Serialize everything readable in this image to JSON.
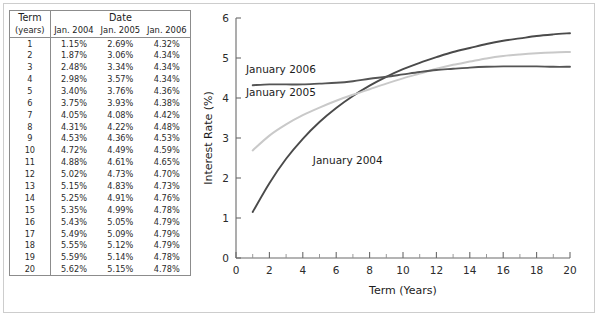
{
  "figure": {
    "background_color": "#ffffff",
    "frame_color": "#cdcdcd"
  },
  "table": {
    "name": "yield-curve-rate-table",
    "header": {
      "term_label": "Term",
      "term_units": "(years)",
      "group_label": "Date",
      "columns": [
        "Jan. 2004",
        "Jan. 2005",
        "Jan. 2006"
      ]
    },
    "column_colors": {
      "jan_2004": "#3f3f3f",
      "jan_2005": "#a8a8a8",
      "jan_2006": "#2b2b2b"
    },
    "rows": [
      {
        "term": "1",
        "jan_2004": "1.15%",
        "jan_2005": "2.69%",
        "jan_2006": "4.32%"
      },
      {
        "term": "2",
        "jan_2004": "1.87%",
        "jan_2005": "3.06%",
        "jan_2006": "4.34%"
      },
      {
        "term": "3",
        "jan_2004": "2.48%",
        "jan_2005": "3.34%",
        "jan_2006": "4.34%"
      },
      {
        "term": "4",
        "jan_2004": "2.98%",
        "jan_2005": "3.57%",
        "jan_2006": "4.34%"
      },
      {
        "term": "5",
        "jan_2004": "3.40%",
        "jan_2005": "3.76%",
        "jan_2006": "4.36%"
      },
      {
        "term": "6",
        "jan_2004": "3.75%",
        "jan_2005": "3.93%",
        "jan_2006": "4.38%"
      },
      {
        "term": "7",
        "jan_2004": "4.05%",
        "jan_2005": "4.08%",
        "jan_2006": "4.42%"
      },
      {
        "term": "8",
        "jan_2004": "4.31%",
        "jan_2005": "4.22%",
        "jan_2006": "4.48%"
      },
      {
        "term": "9",
        "jan_2004": "4.53%",
        "jan_2005": "4.36%",
        "jan_2006": "4.53%"
      },
      {
        "term": "10",
        "jan_2004": "4.72%",
        "jan_2005": "4.49%",
        "jan_2006": "4.59%"
      },
      {
        "term": "11",
        "jan_2004": "4.88%",
        "jan_2005": "4.61%",
        "jan_2006": "4.65%"
      },
      {
        "term": "12",
        "jan_2004": "5.02%",
        "jan_2005": "4.73%",
        "jan_2006": "4.70%"
      },
      {
        "term": "13",
        "jan_2004": "5.15%",
        "jan_2005": "4.83%",
        "jan_2006": "4.73%"
      },
      {
        "term": "14",
        "jan_2004": "5.25%",
        "jan_2005": "4.91%",
        "jan_2006": "4.76%"
      },
      {
        "term": "15",
        "jan_2004": "5.35%",
        "jan_2005": "4.99%",
        "jan_2006": "4.78%"
      },
      {
        "term": "16",
        "jan_2004": "5.43%",
        "jan_2005": "5.05%",
        "jan_2006": "4.79%"
      },
      {
        "term": "17",
        "jan_2004": "5.49%",
        "jan_2005": "5.09%",
        "jan_2006": "4.79%"
      },
      {
        "term": "18",
        "jan_2004": "5.55%",
        "jan_2005": "5.12%",
        "jan_2006": "4.79%"
      },
      {
        "term": "19",
        "jan_2004": "5.59%",
        "jan_2005": "5.14%",
        "jan_2006": "4.78%"
      },
      {
        "term": "20",
        "jan_2004": "5.62%",
        "jan_2005": "5.15%",
        "jan_2006": "4.78%"
      }
    ]
  },
  "chart_data": {
    "type": "line",
    "title": "",
    "xlabel": "Term (Years)",
    "ylabel": "Interest Rate (%)",
    "xlim": [
      0,
      20
    ],
    "ylim": [
      0,
      6
    ],
    "xticks": [
      0,
      2,
      4,
      6,
      8,
      10,
      12,
      14,
      16,
      18,
      20
    ],
    "xtick_labels": [
      "0",
      "2",
      "4",
      "6",
      "8",
      "10",
      "12",
      "14",
      "16",
      "18",
      "20"
    ],
    "xminor_step": 1,
    "yticks": [
      0,
      1,
      2,
      3,
      4,
      5,
      6
    ],
    "ytick_labels": [
      "0",
      "1",
      "2",
      "3",
      "4",
      "5",
      "6"
    ],
    "grid": false,
    "legend_position": "inline-annotations",
    "x": [
      1,
      2,
      3,
      4,
      5,
      6,
      7,
      8,
      9,
      10,
      11,
      12,
      13,
      14,
      15,
      16,
      17,
      18,
      19,
      20
    ],
    "series": [
      {
        "name": "January 2004",
        "color": "#4a4a4a",
        "label_x": 4.6,
        "label_y": 2.35,
        "values": [
          1.15,
          1.87,
          2.48,
          2.98,
          3.4,
          3.75,
          4.05,
          4.31,
          4.53,
          4.72,
          4.88,
          5.02,
          5.15,
          5.25,
          5.35,
          5.43,
          5.49,
          5.55,
          5.59,
          5.62
        ]
      },
      {
        "name": "January 2005",
        "color": "#c9c9c9",
        "label_x": 0.6,
        "label_y": 4.05,
        "values": [
          2.69,
          3.06,
          3.34,
          3.57,
          3.76,
          3.93,
          4.08,
          4.22,
          4.36,
          4.49,
          4.61,
          4.73,
          4.83,
          4.91,
          4.99,
          5.05,
          5.09,
          5.12,
          5.14,
          5.15
        ]
      },
      {
        "name": "January 2006",
        "color": "#555555",
        "label_x": 0.6,
        "label_y": 4.62,
        "values": [
          4.32,
          4.34,
          4.34,
          4.34,
          4.36,
          4.38,
          4.42,
          4.48,
          4.53,
          4.59,
          4.65,
          4.7,
          4.73,
          4.76,
          4.78,
          4.79,
          4.79,
          4.79,
          4.78,
          4.78
        ]
      }
    ]
  }
}
